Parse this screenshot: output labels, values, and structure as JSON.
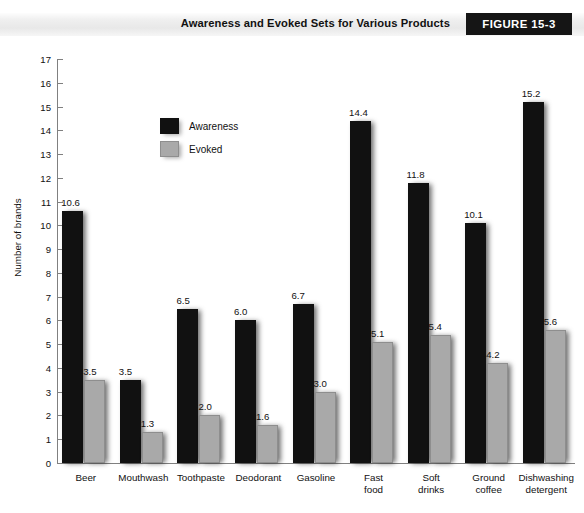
{
  "header": {
    "title": "Awareness and Evoked Sets for Various Products",
    "figure_tag": "FIGURE 15-3"
  },
  "legend": {
    "position": "inside-top-left",
    "items": [
      {
        "label": "Awareness",
        "color": "#111111",
        "icon": "filled-square-icon"
      },
      {
        "label": "Evoked",
        "color": "#a9a9a9",
        "icon": "filled-square-icon"
      }
    ]
  },
  "axes": {
    "ylabel": "Number of brands",
    "yticks": [
      "0",
      "1",
      "2",
      "3",
      "4",
      "5",
      "6",
      "7",
      "8",
      "9",
      "10",
      "11",
      "12",
      "13",
      "14",
      "15",
      "16",
      "17"
    ],
    "ymin": 0,
    "ymax": 17
  },
  "chart_data": {
    "type": "bar",
    "title": "Awareness and Evoked Sets for Various Products",
    "xlabel": "",
    "ylabel": "Number of brands",
    "ylim": [
      0,
      17
    ],
    "ytick_step": 1,
    "grid": false,
    "legend_position": "inside-top-left",
    "categories": [
      "Beer",
      "Mouthwash",
      "Toothpaste",
      "Deodorant",
      "Gasoline",
      "Fast\nfood",
      "Soft\ndrinks",
      "Ground\ncoffee",
      "Dishwashing\ndetergent"
    ],
    "series": [
      {
        "name": "Awareness",
        "color": "#111111",
        "values": [
          10.6,
          3.5,
          6.5,
          6.0,
          6.7,
          14.4,
          11.8,
          10.1,
          15.2
        ],
        "labels": [
          "10.6",
          "3.5",
          "6.5",
          "6.0",
          "6.7",
          "14.4",
          "11.8",
          "10.1",
          "15.2"
        ]
      },
      {
        "name": "Evoked",
        "color": "#a9a9a9",
        "values": [
          3.5,
          1.3,
          2.0,
          1.6,
          3.0,
          5.1,
          5.4,
          4.2,
          5.6
        ],
        "labels": [
          "3.5",
          "1.3",
          "2.0",
          "1.6",
          "3.0",
          "5.1",
          "5.4",
          "4.2",
          "5.6"
        ]
      }
    ]
  }
}
